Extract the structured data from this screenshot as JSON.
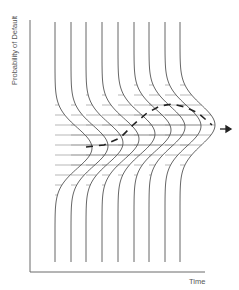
{
  "diagram": {
    "y_axis_label": "Probability of Default",
    "x_axis_label": "Time",
    "colors": {
      "axis": "#6a6a6a",
      "curve": "#555555",
      "hatch": "#9a9a9a",
      "trend": "#222222"
    },
    "axes": {
      "origin": [
        30,
        272
      ],
      "y_top": 20,
      "x_right": 205
    },
    "distributions": [
      {
        "base_x": 55,
        "top": 22,
        "bottom": 262,
        "peak_y": 148,
        "amplitude": 37,
        "spread": 30
      },
      {
        "base_x": 71,
        "top": 22,
        "bottom": 262,
        "peak_y": 146,
        "amplitude": 37,
        "spread": 30
      },
      {
        "base_x": 86,
        "top": 22,
        "bottom": 262,
        "peak_y": 143,
        "amplitude": 37,
        "spread": 30
      },
      {
        "base_x": 102,
        "top": 22,
        "bottom": 262,
        "peak_y": 139,
        "amplitude": 37,
        "spread": 30
      },
      {
        "base_x": 118,
        "top": 22,
        "bottom": 262,
        "peak_y": 134,
        "amplitude": 37,
        "spread": 30
      },
      {
        "base_x": 134,
        "top": 22,
        "bottom": 262,
        "peak_y": 130,
        "amplitude": 37,
        "spread": 30
      },
      {
        "base_x": 149,
        "top": 22,
        "bottom": 262,
        "peak_y": 127,
        "amplitude": 36,
        "spread": 30
      },
      {
        "base_x": 165,
        "top": 22,
        "bottom": 262,
        "peak_y": 126,
        "amplitude": 36,
        "spread": 30
      },
      {
        "base_x": 180,
        "top": 22,
        "bottom": 262,
        "peak_y": 125,
        "amplitude": 35,
        "spread": 30
      }
    ],
    "hatch_spacing": 10,
    "trend_line": {
      "points": [
        [
          86,
          147
        ],
        [
          104,
          145
        ],
        [
          120,
          138
        ],
        [
          133,
          125
        ],
        [
          147,
          113
        ],
        [
          160,
          106
        ],
        [
          172,
          104
        ],
        [
          185,
          107
        ],
        [
          198,
          113
        ],
        [
          212,
          125
        ]
      ],
      "arrow": {
        "from": [
          220,
          129
        ],
        "to": [
          231,
          129
        ]
      }
    }
  }
}
